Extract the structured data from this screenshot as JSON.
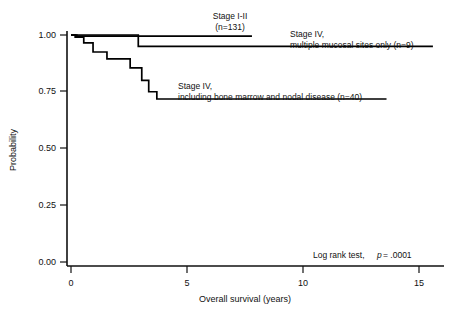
{
  "chart_data": {
    "type": "line",
    "subtype": "kaplan-meier-survival",
    "title": "",
    "xlabel": "Overall survival (years)",
    "ylabel": "Probability",
    "xlim": [
      0,
      15.8
    ],
    "ylim": [
      0.0,
      1.02
    ],
    "xticks": [
      0,
      5,
      10,
      15
    ],
    "xtick_labels": [
      "0",
      "5",
      "10",
      "15"
    ],
    "yticks": [
      0.0,
      0.25,
      0.5,
      0.75,
      1.0
    ],
    "ytick_labels": [
      "0.00",
      "0.25",
      "0.50",
      "0.75",
      "1.00"
    ],
    "grid": false,
    "legend_position": "inline-annotations",
    "series": [
      {
        "name": "Stage I-II",
        "n": 131,
        "label_line1": "Stage I-II",
        "label_line2": "(n=131)",
        "color": "#000000",
        "steps": [
          [
            0.0,
            1.0
          ],
          [
            0.25,
            0.995
          ],
          [
            7.8,
            0.995
          ]
        ]
      },
      {
        "name": "Stage IV, multiple mucosal sites only",
        "n": 9,
        "label_line1": "Stage IV,",
        "label_line2": "multiple mucosal sites only (n=9)",
        "color": "#000000",
        "steps": [
          [
            0.0,
            1.0
          ],
          [
            2.9,
            1.0
          ],
          [
            2.9,
            0.95
          ],
          [
            15.6,
            0.95
          ]
        ]
      },
      {
        "name": "Stage IV, including bone marrow and nodal disease",
        "n": 40,
        "label_line1": "Stage IV,",
        "label_line2": "including bone marrow and nodal disease (n=40)",
        "color": "#000000",
        "steps": [
          [
            0.0,
            1.0
          ],
          [
            0.18,
            0.99
          ],
          [
            0.55,
            0.99
          ],
          [
            0.55,
            0.965
          ],
          [
            0.95,
            0.965
          ],
          [
            0.95,
            0.925
          ],
          [
            1.55,
            0.925
          ],
          [
            1.55,
            0.895
          ],
          [
            2.55,
            0.895
          ],
          [
            2.55,
            0.855
          ],
          [
            3.05,
            0.855
          ],
          [
            3.05,
            0.8
          ],
          [
            3.35,
            0.8
          ],
          [
            3.35,
            0.75
          ],
          [
            3.7,
            0.75
          ],
          [
            3.7,
            0.718
          ],
          [
            13.6,
            0.718
          ]
        ]
      }
    ],
    "annotations": [
      {
        "name": "log-rank-annotation",
        "text_plain": "Log rank test,",
        "text_italic": "p",
        "text_tail": "= .0001",
        "full_text": "Log rank test,  p = .0001"
      }
    ]
  }
}
